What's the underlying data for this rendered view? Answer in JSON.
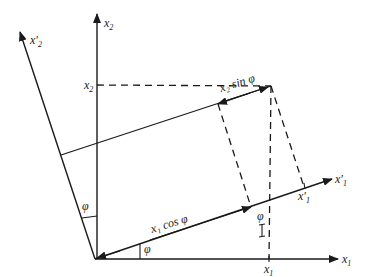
{
  "diagram": {
    "stroke_color": "#1a1a1a",
    "background": "#ffffff",
    "axes": {
      "x1": {
        "label": "x",
        "sub": "1"
      },
      "x2": {
        "label": "x",
        "sub": "2"
      },
      "x1_prime": {
        "label": "x′",
        "sub": "1"
      },
      "x2_prime": {
        "label": "x′",
        "sub": "2"
      }
    },
    "ticks": {
      "x2_value": {
        "label": "x",
        "sub": "2"
      },
      "x1_value": {
        "label": "x",
        "sub": "1"
      },
      "x1_prime_value": {
        "label": "x′",
        "sub": "1"
      }
    },
    "annotations": {
      "x2_sin_phi": "x₂ sin φ",
      "x1_cos_phi": "x₁ cos φ",
      "angle_phi_bottom": "φ",
      "angle_phi_left": "φ",
      "angle_phi_right": "φ"
    }
  }
}
